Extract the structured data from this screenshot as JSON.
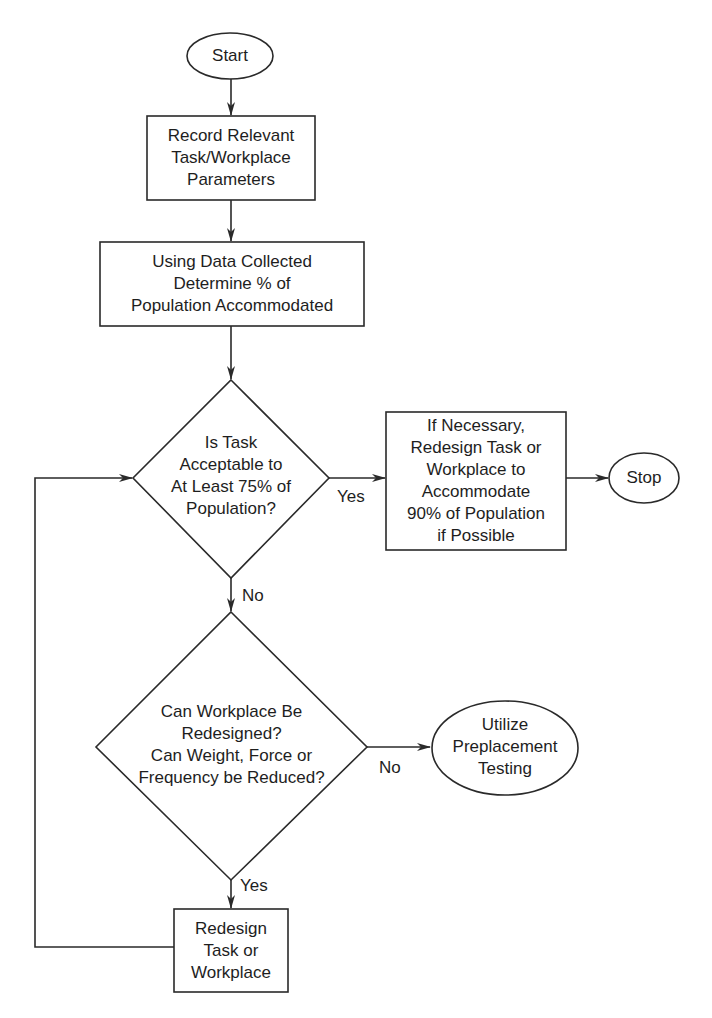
{
  "diagram": {
    "type": "flowchart",
    "nodes": {
      "start": {
        "shape": "ellipse",
        "label": "Start"
      },
      "record": {
        "shape": "rect",
        "lines": [
          "Record Relevant",
          "Task/Workplace",
          "Parameters"
        ]
      },
      "determine": {
        "shape": "rect",
        "lines": [
          "Using Data Collected",
          "Determine % of",
          "Population Accommodated"
        ]
      },
      "decision1": {
        "shape": "diamond",
        "lines": [
          "Is Task",
          "Acceptable to",
          "At Least 75% of",
          "Population?"
        ]
      },
      "redesign90": {
        "shape": "rect",
        "lines": [
          "If Necessary,",
          "Redesign Task or",
          "Workplace to",
          "Accommodate",
          "90% of Population",
          "if Possible"
        ]
      },
      "stop": {
        "shape": "ellipse",
        "label": "Stop"
      },
      "decision2": {
        "shape": "diamond",
        "lines": [
          "Can Workplace Be",
          "Redesigned?",
          "Can Weight, Force or",
          "Frequency be Reduced?"
        ]
      },
      "preplacement": {
        "shape": "ellipse",
        "lines": [
          "Utilize",
          "Preplacement",
          "Testing"
        ]
      },
      "redesign": {
        "shape": "rect",
        "lines": [
          "Redesign",
          "Task or",
          "Workplace"
        ]
      }
    },
    "edges": {
      "d1_yes": "Yes",
      "d1_no": "No",
      "d2_no": "No",
      "d2_yes": "Yes"
    },
    "edge_list": [
      {
        "from": "start",
        "to": "record",
        "label": ""
      },
      {
        "from": "record",
        "to": "determine",
        "label": ""
      },
      {
        "from": "determine",
        "to": "decision1",
        "label": ""
      },
      {
        "from": "decision1",
        "to": "redesign90",
        "label": "Yes"
      },
      {
        "from": "redesign90",
        "to": "stop",
        "label": ""
      },
      {
        "from": "decision1",
        "to": "decision2",
        "label": "No"
      },
      {
        "from": "decision2",
        "to": "preplacement",
        "label": "No"
      },
      {
        "from": "decision2",
        "to": "redesign",
        "label": "Yes"
      },
      {
        "from": "redesign",
        "to": "decision1",
        "label": ""
      }
    ],
    "colors": {
      "stroke": "#2a2a2a",
      "background": "#ffffff",
      "text": "#1e1e1e"
    }
  }
}
